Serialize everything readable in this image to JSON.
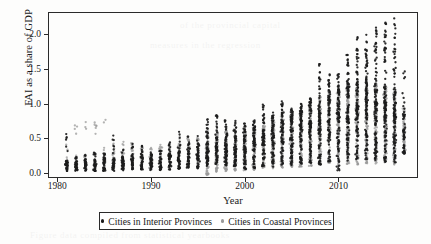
{
  "chart_data": {
    "type": "scatter",
    "title": "",
    "xlabel": "Year",
    "ylabel": "FAI as a share of GDP",
    "xlim": [
      1979.0,
      1918.0
    ],
    "x_axis_range": [
      1979.0,
      2018.5
    ],
    "ylim": [
      -0.07,
      2.32
    ],
    "grid": false,
    "xticks": [
      1980,
      1990,
      2000,
      2010
    ],
    "yticks": [
      "0.0",
      "0.5",
      "1.0",
      "1.5",
      "2.0"
    ],
    "ytick_values": [
      0.0,
      0.5,
      1.0,
      1.5,
      2.0
    ],
    "legend_position": "below-axes",
    "colors": {
      "interior": "#1c1c1c",
      "coastal": "#9a9a9a",
      "frame": "#2a2a2a",
      "background": "#fdfdfc"
    },
    "series": [
      {
        "name": "Cities in Interior Provinces",
        "marker": "dot",
        "color": "#1c1c1c",
        "years": [
          1981,
          1982,
          1983,
          1984,
          1985,
          1986,
          1987,
          1988,
          1989,
          1990,
          1991,
          1992,
          1993,
          1994,
          1995,
          1996,
          1997,
          1998,
          1999,
          2000,
          2001,
          2002,
          2003,
          2004,
          2005,
          2006,
          2007,
          2008,
          2009,
          2010,
          2011,
          2012,
          2013,
          2014,
          2015,
          2016,
          2017
        ],
        "n_per_year": [
          34,
          36,
          36,
          36,
          38,
          38,
          40,
          40,
          40,
          42,
          42,
          44,
          46,
          46,
          48,
          60,
          62,
          64,
          66,
          68,
          70,
          72,
          74,
          76,
          80,
          84,
          88,
          92,
          96,
          100,
          104,
          108,
          110,
          112,
          112,
          112,
          56
        ],
        "min": [
          0.03,
          0.03,
          0.03,
          0.03,
          0.03,
          0.03,
          0.04,
          0.05,
          0.05,
          0.04,
          0.04,
          0.05,
          0.06,
          0.07,
          0.07,
          0.1,
          0.12,
          0.11,
          0.1,
          0.02,
          0.06,
          0.1,
          0.09,
          0.12,
          0.11,
          0.13,
          0.14,
          0.12,
          0.17,
          0.04,
          0.18,
          0.2,
          0.2,
          0.19,
          0.16,
          0.14,
          0.28
        ],
        "q25": [
          0.09,
          0.09,
          0.1,
          0.1,
          0.11,
          0.11,
          0.12,
          0.13,
          0.12,
          0.11,
          0.11,
          0.13,
          0.17,
          0.17,
          0.18,
          0.26,
          0.3,
          0.28,
          0.29,
          0.3,
          0.33,
          0.36,
          0.4,
          0.44,
          0.46,
          0.49,
          0.53,
          0.58,
          0.66,
          0.68,
          0.72,
          0.76,
          0.78,
          0.78,
          0.74,
          0.7,
          0.52
        ],
        "median": [
          0.13,
          0.14,
          0.15,
          0.15,
          0.16,
          0.16,
          0.18,
          0.19,
          0.18,
          0.16,
          0.17,
          0.2,
          0.24,
          0.24,
          0.26,
          0.36,
          0.4,
          0.38,
          0.4,
          0.41,
          0.45,
          0.49,
          0.55,
          0.6,
          0.63,
          0.67,
          0.73,
          0.8,
          0.89,
          0.92,
          0.97,
          1.02,
          1.05,
          1.05,
          1.0,
          0.95,
          0.7
        ],
        "q75": [
          0.18,
          0.19,
          0.2,
          0.21,
          0.22,
          0.22,
          0.24,
          0.25,
          0.24,
          0.22,
          0.23,
          0.27,
          0.32,
          0.32,
          0.34,
          0.47,
          0.52,
          0.5,
          0.52,
          0.53,
          0.58,
          0.63,
          0.71,
          0.77,
          0.81,
          0.86,
          0.94,
          1.03,
          1.14,
          1.18,
          1.25,
          1.32,
          1.35,
          1.34,
          1.28,
          1.22,
          0.88
        ],
        "max": [
          0.59,
          0.25,
          0.28,
          0.3,
          0.32,
          0.58,
          0.38,
          0.42,
          0.43,
          0.33,
          0.37,
          0.45,
          0.65,
          0.53,
          0.55,
          0.8,
          0.85,
          0.76,
          0.78,
          0.72,
          0.79,
          1.0,
          0.88,
          1.05,
          0.93,
          1.0,
          1.1,
          1.59,
          1.47,
          1.5,
          1.74,
          1.97,
          2.0,
          2.1,
          2.17,
          2.25,
          1.7
        ]
      },
      {
        "name": "Cities in Coastal Provinces",
        "marker": "dot",
        "color": "#9a9a9a",
        "years": [
          1981,
          1982,
          1983,
          1984,
          1985,
          1986,
          1987,
          1988,
          1989,
          1990,
          1991,
          1992,
          1993,
          1994,
          1995,
          1996,
          1997,
          1998,
          1999,
          2000,
          2001,
          2002,
          2003,
          2004,
          2005,
          2006,
          2007,
          2008,
          2009,
          2010,
          2011,
          2012,
          2013,
          2014,
          2015,
          2016,
          2017
        ],
        "n_per_year": [
          16,
          18,
          18,
          18,
          18,
          20,
          20,
          20,
          20,
          22,
          22,
          24,
          26,
          26,
          28,
          78,
          80,
          82,
          84,
          86,
          88,
          90,
          92,
          94,
          96,
          98,
          100,
          102,
          104,
          106,
          108,
          110,
          112,
          112,
          112,
          112,
          56
        ],
        "min": [
          0.05,
          0.06,
          0.06,
          0.06,
          0.06,
          0.06,
          0.07,
          0.07,
          0.07,
          0.06,
          0.06,
          0.08,
          0.09,
          0.1,
          0.1,
          -0.03,
          0.02,
          0.03,
          0.03,
          0.04,
          0.05,
          0.06,
          0.07,
          0.08,
          0.09,
          0.09,
          0.1,
          0.1,
          0.11,
          0.11,
          0.12,
          0.12,
          0.13,
          0.13,
          0.12,
          0.12,
          0.28
        ],
        "q25": [
          0.12,
          0.13,
          0.14,
          0.14,
          0.15,
          0.15,
          0.17,
          0.18,
          0.17,
          0.15,
          0.16,
          0.18,
          0.22,
          0.23,
          0.24,
          0.22,
          0.25,
          0.24,
          0.25,
          0.26,
          0.28,
          0.31,
          0.34,
          0.37,
          0.39,
          0.42,
          0.45,
          0.48,
          0.53,
          0.55,
          0.58,
          0.6,
          0.61,
          0.6,
          0.57,
          0.54,
          0.42
        ],
        "median": [
          0.18,
          0.19,
          0.2,
          0.21,
          0.22,
          0.22,
          0.25,
          0.26,
          0.25,
          0.22,
          0.23,
          0.27,
          0.32,
          0.33,
          0.35,
          0.33,
          0.37,
          0.36,
          0.37,
          0.39,
          0.42,
          0.46,
          0.5,
          0.54,
          0.57,
          0.61,
          0.66,
          0.71,
          0.77,
          0.8,
          0.84,
          0.87,
          0.88,
          0.86,
          0.82,
          0.78,
          0.58
        ],
        "q75": [
          0.24,
          0.26,
          0.27,
          0.28,
          0.29,
          0.3,
          0.33,
          0.34,
          0.33,
          0.29,
          0.31,
          0.36,
          0.42,
          0.43,
          0.45,
          0.44,
          0.49,
          0.48,
          0.49,
          0.52,
          0.56,
          0.61,
          0.66,
          0.72,
          0.76,
          0.81,
          0.88,
          0.95,
          1.02,
          1.06,
          1.11,
          1.15,
          1.16,
          1.13,
          1.08,
          1.02,
          0.76
        ],
        "max": [
          0.43,
          0.89,
          0.83,
          0.84,
          0.85,
          0.43,
          0.49,
          0.49,
          0.42,
          0.37,
          0.41,
          0.47,
          0.55,
          0.5,
          0.52,
          0.62,
          0.65,
          0.62,
          0.65,
          0.61,
          0.66,
          0.68,
          0.74,
          0.82,
          0.85,
          0.9,
          0.97,
          1.1,
          1.2,
          1.24,
          1.3,
          1.34,
          1.35,
          1.32,
          1.26,
          1.2,
          0.95
        ]
      }
    ]
  },
  "legend": {
    "items": [
      {
        "label": "Cities in Interior Provinces",
        "color": "#1c1c1c"
      },
      {
        "label": "Cities in Coastal Provinces",
        "color": "#9a9a9a"
      }
    ]
  },
  "axes": {
    "y_title": "FAI as a share of GDP",
    "x_title": "Year",
    "y_ticks": [
      "0.0",
      "0.5",
      "1.0",
      "1.5",
      "2.0"
    ],
    "x_ticks": [
      "1980",
      "1990",
      "2000",
      "2010"
    ]
  }
}
